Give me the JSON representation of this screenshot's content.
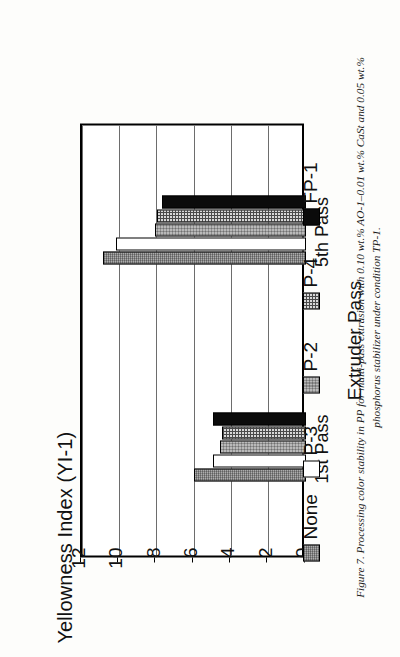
{
  "figure": {
    "caption": "Figure 7. Processing color stability in PP for multi-pass extrusion with 0.10 wt.% AO-1–0.01 wt.% CaSt and 0.05 wt.% phosphorus stabilizer under condition TP-1."
  },
  "legend": {
    "position": "bottom",
    "items": [
      {
        "label": "None",
        "pattern": "dotted-gray",
        "color": "#8a8a8a"
      },
      {
        "label": "P-3",
        "pattern": "solid-white",
        "color": "#ffffff"
      },
      {
        "label": "P-2",
        "pattern": "fine-crosshatch-gray",
        "color": "#b9b9b9"
      },
      {
        "label": "P-4",
        "pattern": "grid-mesh",
        "color": "#d8d8d8"
      },
      {
        "label": "FP-1",
        "pattern": "solid-black",
        "color": "#0b0b0b"
      }
    ]
  },
  "chart_data": {
    "type": "bar",
    "orientation": "vertical",
    "title": "",
    "xlabel": "Extruder Pass",
    "ylabel": "Yellowness Index (YI-1)",
    "categories": [
      "1st Pass",
      "5th Pass"
    ],
    "ylim": [
      0,
      12
    ],
    "yticks": [
      0,
      2,
      4,
      6,
      8,
      10,
      12
    ],
    "ytick_labels": [
      "0",
      "2",
      "4",
      "6",
      "8",
      "10",
      "12"
    ],
    "grid": true,
    "grid_axis": "y",
    "series": [
      {
        "name": "None",
        "values": [
          6.0,
          10.9
        ]
      },
      {
        "name": "P-3",
        "values": [
          5.0,
          10.2
        ]
      },
      {
        "name": "P-2",
        "values": [
          4.6,
          8.1
        ]
      },
      {
        "name": "P-4",
        "values": [
          4.5,
          8.0
        ]
      },
      {
        "name": "FP-1",
        "values": [
          5.0,
          7.7
        ]
      }
    ]
  }
}
